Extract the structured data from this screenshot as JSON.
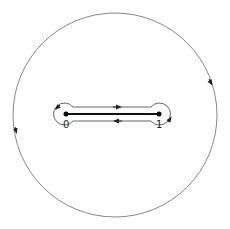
{
  "diagram": {
    "type": "contour-around-segment",
    "outer_circle": {
      "cx": 115,
      "cy": 115,
      "r": 102,
      "direction": "counterclockwise",
      "stroke": "#777777"
    },
    "inner_contour": {
      "shape": "dumbbell",
      "left_lobe": {
        "cx": 66,
        "cy": 114,
        "r": 11
      },
      "right_lobe": {
        "cx": 159,
        "cy": 114,
        "r": 11
      },
      "top_line_y": 107,
      "bottom_line_y": 121,
      "stroke": "#555555"
    },
    "segment": {
      "x1": 66,
      "x2": 159,
      "y": 114,
      "stroke": "#111111"
    },
    "points": [
      {
        "label": "0",
        "x": 66,
        "y": 114
      },
      {
        "label": "1",
        "x": 159,
        "y": 114
      }
    ],
    "arrows": [
      {
        "location": "outer-right",
        "direction": "down"
      },
      {
        "location": "outer-left",
        "direction": "down"
      },
      {
        "location": "inner-top",
        "direction": "right"
      },
      {
        "location": "inner-bottom",
        "direction": "left"
      },
      {
        "location": "left-lobe",
        "direction": "down"
      },
      {
        "location": "right-lobe",
        "direction": "up"
      }
    ]
  }
}
